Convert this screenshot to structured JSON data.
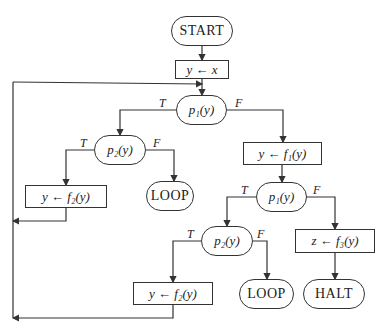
{
  "diagram": {
    "type": "flowchart",
    "nodes": {
      "start": "START",
      "assign_x": "y ← x",
      "p1_top": "p₁(y)",
      "p2_left": "p₂(y)",
      "f1": "y ← f₁(y)",
      "f2_left": "y ← f₂(y)",
      "loop_left": "LOOP",
      "p1_mid": "p₁(y)",
      "p2_mid": "p₂(y)",
      "f3": "z ← f₃(y)",
      "f2_bottom": "y ← f₂(y)",
      "loop_right": "LOOP",
      "halt": "HALT"
    },
    "branch_labels": {
      "true": "T",
      "false": "F"
    },
    "edges": [
      {
        "from": "start",
        "to": "assign_x"
      },
      {
        "from": "assign_x",
        "to": "p1_top"
      },
      {
        "from": "p1_top",
        "to": "p2_left",
        "label": "T"
      },
      {
        "from": "p1_top",
        "to": "f1",
        "label": "F"
      },
      {
        "from": "p2_left",
        "to": "f2_left",
        "label": "T"
      },
      {
        "from": "p2_left",
        "to": "loop_left",
        "label": "F"
      },
      {
        "from": "f2_left",
        "to": "p1_top"
      },
      {
        "from": "f1",
        "to": "p1_mid"
      },
      {
        "from": "p1_mid",
        "to": "p2_mid",
        "label": "T"
      },
      {
        "from": "p1_mid",
        "to": "f3",
        "label": "F"
      },
      {
        "from": "p2_mid",
        "to": "f2_bottom",
        "label": "T"
      },
      {
        "from": "p2_mid",
        "to": "loop_right",
        "label": "F"
      },
      {
        "from": "f2_bottom",
        "to": "p1_top"
      },
      {
        "from": "f3",
        "to": "halt"
      }
    ]
  }
}
